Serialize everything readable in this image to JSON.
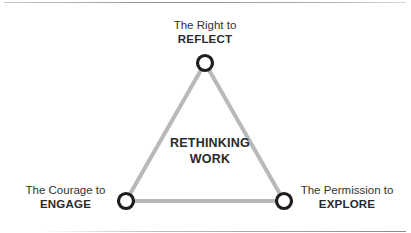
{
  "diagram": {
    "type": "triangle",
    "center": {
      "line1": "RETHINKING",
      "line2": "WORK"
    },
    "nodes": [
      {
        "id": "top",
        "pre": "The Right to",
        "key": "REFLECT"
      },
      {
        "id": "bottom-left",
        "pre": "The Courage to",
        "key": "ENGAGE"
      },
      {
        "id": "bottom-right",
        "pre": "The Permission to",
        "key": "EXPLORE"
      }
    ],
    "colors": {
      "edge": "#b9b9b9",
      "node_stroke": "#1e1e1e",
      "text": "#2a2a2a"
    }
  }
}
